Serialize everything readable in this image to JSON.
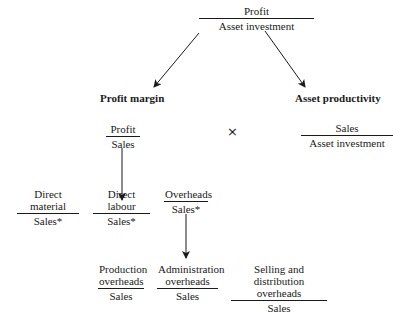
{
  "diagram": {
    "root": {
      "numerator": "Profit",
      "denominator": "Asset investment"
    },
    "left_branch": {
      "title": "Profit margin",
      "ratio": {
        "numerator": "Profit",
        "denominator": "Sales"
      }
    },
    "operator": "×",
    "right_branch": {
      "title": "Asset productivity",
      "ratio": {
        "numerator": "Sales",
        "denominator": "Asset investment"
      }
    },
    "cost_ratios": [
      {
        "numerator": "Direct material",
        "denominator": "Sales*"
      },
      {
        "numerator": "Direct labour",
        "denominator": "Sales*"
      },
      {
        "numerator": "Overheads",
        "denominator": "Sales*"
      }
    ],
    "overhead_ratios": [
      {
        "numerator_line1": "Production",
        "numerator_line2": "overheads",
        "denominator": "Sales"
      },
      {
        "numerator_line1": "Administration",
        "numerator_line2": "overheads",
        "denominator": "Sales"
      },
      {
        "numerator_line1": "Selling and distribution",
        "numerator_line2": "overheads",
        "denominator": "Sales"
      }
    ],
    "edges": [
      {
        "from": "root",
        "to": "left_branch",
        "type": "arrow"
      },
      {
        "from": "root",
        "to": "right_branch",
        "type": "arrow"
      },
      {
        "from": "left_branch.ratio",
        "to": "cost_ratios",
        "type": "arrow"
      },
      {
        "from": "cost_ratios.2",
        "to": "overhead_ratios",
        "type": "arrow"
      }
    ],
    "colors": {
      "ink": "#1a1a1a",
      "background": "#ffffff"
    }
  }
}
